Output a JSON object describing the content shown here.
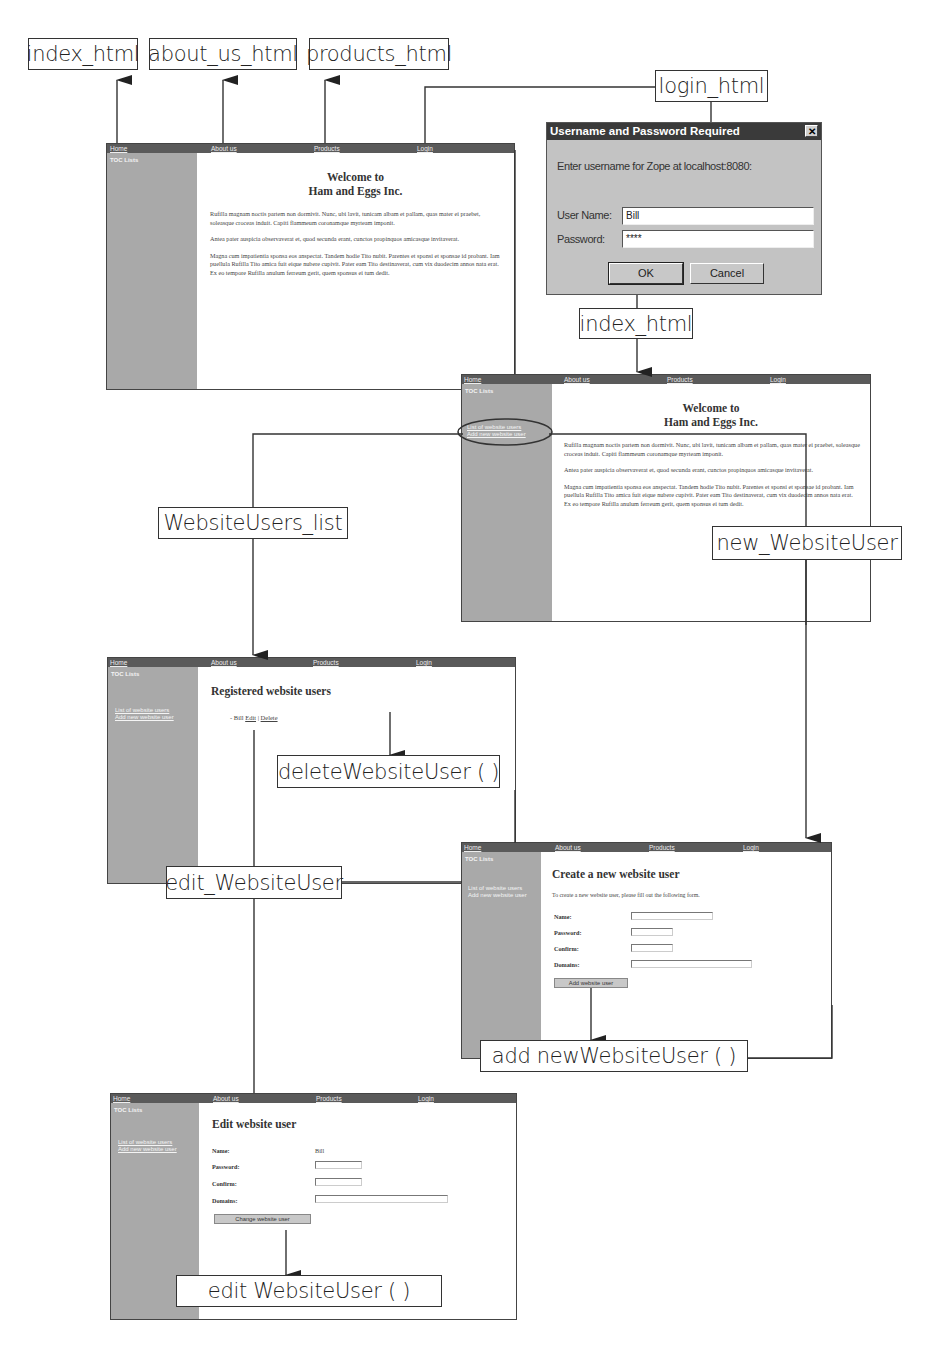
{
  "diagram": {
    "nodes": {
      "index_top": "index_html",
      "about_us": "about_us_html",
      "products": "products_html",
      "login": "login_html",
      "index_mid": "index_html",
      "users_list": "WebsiteUsers_list",
      "new_user": "new_WebsiteUser",
      "delete_user": "deleteWebsiteUser ( )",
      "edit_user": "edit_WebsiteUser",
      "add_user_action": "add newWebsiteUser ( )",
      "edit_user_action": "edit WebsiteUser ( )"
    }
  },
  "site": {
    "nav": {
      "home": "Home",
      "about": "About us",
      "products": "Products",
      "login": "Login"
    },
    "sidebar": {
      "toc": "TOC Lists",
      "link_list": "List of website users",
      "link_add": "Add new website user"
    }
  },
  "home_page": {
    "title_line1": "Welcome to",
    "title_line2": "Ham and Eggs Inc.",
    "paragraphs": [
      "Rufilla magnam noctis partem non dormivit. Nunc, ubi lavit, tunicam albam et pallam, quas mater ei praebet, soleasque croceas induit. Capiti flammeum coronamque myrteam imponit.",
      "Antea pater auspicia observaverat et, quod secunda erant, cunctos propinquos amicasque invitaverat.",
      "Magna cum impatientia sponsa eos anspectat. Tandem hodie Tito nubit. Parentes et sponsi et sponsae id probant. Iam puellula Rufilla Tito amica fuit eique nubere cupivit. Pater eam Tito destinaverat, cum vix duodecim annos nata erat. Ex eo tempore Rufilla anulum ferreum gerit, quem sponsus ei tum dedit."
    ]
  },
  "login_dialog": {
    "title": "Username and Password Required",
    "close": "✕",
    "prompt": "Enter username for Zope at localhost:8080:",
    "username_label": "User Name:",
    "username_value": "Bill",
    "password_label": "Password:",
    "password_value": "****",
    "ok_label": "OK",
    "cancel_label": "Cancel"
  },
  "users_page": {
    "title": "Registered website users",
    "bullet": "-",
    "user_name": "Bill",
    "edit_link": "Edit",
    "separator": "|",
    "delete_link": "Delete"
  },
  "create_page": {
    "title": "Create a new website user",
    "intro": "To create a new website user, please fill out the following form.",
    "name_label": "Name:",
    "password_label": "Password:",
    "confirm_label": "Confirm:",
    "domains_label": "Domains:",
    "submit_label": "Add website user"
  },
  "edit_page": {
    "title": "Edit website user",
    "name_label": "Name:",
    "name_value": "Bill",
    "password_label": "Password:",
    "confirm_label": "Confirm:",
    "domains_label": "Domains:",
    "submit_label": "Change website user"
  },
  "colors": {
    "navbar": "#5a5a5a",
    "sidebar": "#a9a9a9",
    "dialog_title": "#3a3a3a",
    "dialog_body": "#c3c3c3",
    "lines": "#333333"
  }
}
